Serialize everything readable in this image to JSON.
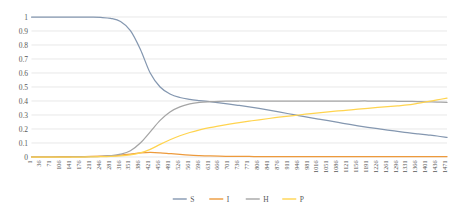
{
  "chart_data": {
    "type": "line",
    "title": "",
    "subtitle": "",
    "xlabel": "",
    "ylabel": "",
    "grid": "horizontal",
    "legend_position": "bottom",
    "ylim": [
      0,
      1
    ],
    "ytick_labels": [
      "1",
      "0.9",
      "0.8",
      "0.7",
      "0.6",
      "0.5",
      "0.4",
      "0.3",
      "0.2",
      "0.1",
      "0"
    ],
    "ytick_values": [
      1,
      0.9,
      0.8,
      0.7,
      0.6,
      0.5,
      0.4,
      0.3,
      0.2,
      0.1,
      0
    ],
    "xtick_labels": [
      "1",
      "36",
      "71",
      "106",
      "141",
      "176",
      "211",
      "246",
      "281",
      "316",
      "351",
      "386",
      "421",
      "456",
      "491",
      "526",
      "561",
      "596",
      "631",
      "666",
      "701",
      "736",
      "771",
      "806",
      "841",
      "876",
      "911",
      "946",
      "981",
      "1016",
      "1051",
      "1086",
      "1121",
      "1156",
      "1191",
      "1226",
      "1261",
      "1296",
      "1331",
      "1366",
      "1401",
      "1436",
      "1471"
    ],
    "x": [
      1,
      36,
      71,
      106,
      141,
      176,
      211,
      246,
      281,
      316,
      351,
      386,
      421,
      456,
      491,
      526,
      561,
      596,
      631,
      666,
      701,
      736,
      771,
      806,
      841,
      876,
      911,
      946,
      981,
      1016,
      1051,
      1086,
      1121,
      1156,
      1191,
      1226,
      1261,
      1296,
      1331,
      1366,
      1401,
      1436,
      1471
    ],
    "series": [
      {
        "name": "S",
        "color": "#8497B0",
        "values": [
          1.0,
          1.0,
          1.0,
          1.0,
          1.0,
          1.0,
          0.999,
          0.997,
          0.99,
          0.968,
          0.903,
          0.77,
          0.6,
          0.5,
          0.45,
          0.425,
          0.412,
          0.403,
          0.395,
          0.387,
          0.378,
          0.368,
          0.358,
          0.347,
          0.335,
          0.322,
          0.309,
          0.296,
          0.283,
          0.271,
          0.259,
          0.247,
          0.235,
          0.223,
          0.212,
          0.202,
          0.192,
          0.183,
          0.174,
          0.166,
          0.158,
          0.15,
          0.14
        ]
      },
      {
        "name": "I",
        "color": "#ED9A3C",
        "values": [
          0.001,
          0.001,
          0.001,
          0.002,
          0.002,
          0.003,
          0.004,
          0.006,
          0.009,
          0.014,
          0.021,
          0.029,
          0.033,
          0.03,
          0.024,
          0.018,
          0.013,
          0.01,
          0.008,
          0.006,
          0.005,
          0.004,
          0.004,
          0.003,
          0.003,
          0.003,
          0.002,
          0.002,
          0.002,
          0.002,
          0.002,
          0.002,
          0.002,
          0.002,
          0.002,
          0.002,
          0.002,
          0.002,
          0.002,
          0.002,
          0.002,
          0.002,
          0.002
        ]
      },
      {
        "name": "H",
        "color": "#A5A5A5",
        "values": [
          0.0,
          0.0,
          0.0,
          0.0,
          0.0,
          0.001,
          0.002,
          0.004,
          0.009,
          0.02,
          0.045,
          0.1,
          0.18,
          0.262,
          0.322,
          0.358,
          0.379,
          0.39,
          0.395,
          0.398,
          0.399,
          0.4,
          0.4,
          0.4,
          0.4,
          0.4,
          0.4,
          0.4,
          0.4,
          0.4,
          0.4,
          0.4,
          0.4,
          0.4,
          0.4,
          0.399,
          0.399,
          0.398,
          0.397,
          0.396,
          0.394,
          0.392,
          0.39
        ]
      },
      {
        "name": "P",
        "color": "#FFD44F",
        "values": [
          0.0,
          0.0,
          0.0,
          0.0,
          0.0,
          0.0,
          0.001,
          0.002,
          0.004,
          0.008,
          0.016,
          0.03,
          0.055,
          0.09,
          0.123,
          0.152,
          0.175,
          0.194,
          0.21,
          0.223,
          0.235,
          0.246,
          0.256,
          0.266,
          0.275,
          0.284,
          0.292,
          0.3,
          0.308,
          0.315,
          0.322,
          0.329,
          0.335,
          0.342,
          0.348,
          0.354,
          0.36,
          0.366,
          0.372,
          0.383,
          0.395,
          0.408,
          0.42
        ]
      }
    ],
    "legend": [
      {
        "label": "S",
        "color": "#8497B0"
      },
      {
        "label": "I",
        "color": "#ED9A3C"
      },
      {
        "label": "H",
        "color": "#A5A5A5"
      },
      {
        "label": "P",
        "color": "#FFD44F"
      }
    ]
  }
}
